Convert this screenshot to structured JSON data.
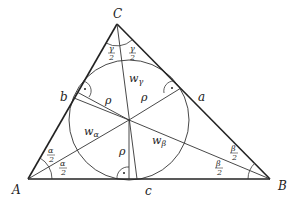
{
  "diagram": {
    "vertices": {
      "A": {
        "label": "A",
        "x": 28,
        "y": 179
      },
      "B": {
        "label": "B",
        "x": 270,
        "y": 179
      },
      "C": {
        "label": "C",
        "x": 117,
        "y": 24
      }
    },
    "incenter": {
      "x": 129,
      "y": 120
    },
    "incircle_radius": 60,
    "sides": {
      "a": "a",
      "b": "b",
      "c": "c"
    },
    "bisectors": {
      "w_alpha": "w",
      "w_alpha_sub": "α",
      "w_beta": "w",
      "w_beta_sub": "β",
      "w_gamma": "w",
      "w_gamma_sub": "γ"
    },
    "radius_label": "ρ",
    "half_angles": {
      "alpha": {
        "num": "α",
        "den": "2"
      },
      "beta": {
        "num": "β",
        "den": "2"
      },
      "gamma": {
        "num": "γ",
        "den": "2"
      }
    },
    "right_angle_mark": "·"
  }
}
